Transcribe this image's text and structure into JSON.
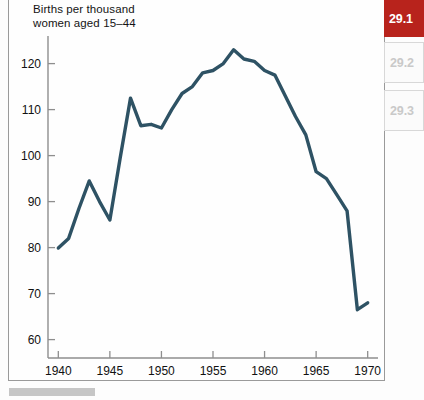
{
  "figure": {
    "title": "Births per thousand\nwomen aged 15–44"
  },
  "section_rail": {
    "tabs": [
      {
        "label": "29.1",
        "state": "active"
      },
      {
        "label": "29.2",
        "state": "inactive"
      },
      {
        "label": "29.3",
        "state": "inactive"
      }
    ]
  },
  "colors": {
    "accent_red": "#b8231c",
    "line": "#2e5264",
    "axis": "#8e8e8e",
    "inactive_tab_text": "#c9c9c9",
    "caption_bar": "#c6c6c6"
  },
  "chart_data": {
    "type": "line",
    "title": "Births per thousand women aged 15–44",
    "xlabel": "",
    "ylabel": "Births per thousand women aged 15–44",
    "xlim": [
      1939,
      1971
    ],
    "ylim": [
      56,
      126
    ],
    "xticks": [
      1940,
      1945,
      1950,
      1955,
      1960,
      1965,
      1970
    ],
    "yticks": [
      60,
      70,
      80,
      90,
      100,
      110,
      120
    ],
    "grid": false,
    "legend": null,
    "series": [
      {
        "name": "Births per thousand women aged 15-44",
        "color": "#2e5264",
        "x": [
          1940,
          1941,
          1942,
          1943,
          1944,
          1945,
          1946,
          1947,
          1948,
          1949,
          1950,
          1951,
          1952,
          1953,
          1954,
          1955,
          1956,
          1957,
          1958,
          1959,
          1960,
          1961,
          1962,
          1963,
          1964,
          1965,
          1966,
          1967,
          1968,
          1969,
          1970
        ],
        "values": [
          79.9,
          82.0,
          88.5,
          94.5,
          90.0,
          86.0,
          99.5,
          112.5,
          106.5,
          106.8,
          106.0,
          110.0,
          113.5,
          115.0,
          118.0,
          118.5,
          120.0,
          123.0,
          121.0,
          120.5,
          118.5,
          117.5,
          113.0,
          108.5,
          104.5,
          96.5,
          95.0,
          91.5,
          88.0,
          66.5,
          68.0
        ]
      }
    ]
  }
}
